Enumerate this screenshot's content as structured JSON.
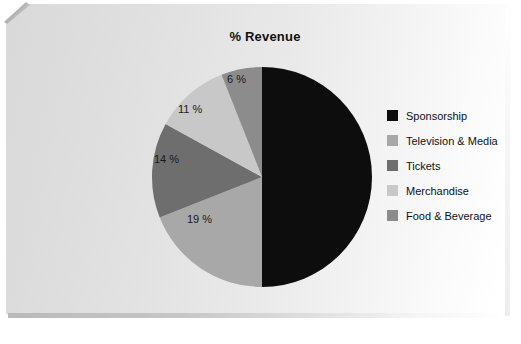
{
  "chart_data": {
    "type": "pie",
    "title": "% Revenue",
    "categories": [
      "Sponsorship",
      "Television & Media",
      "Tickets",
      "Merchandise",
      "Food & Beverage"
    ],
    "values": [
      50,
      19,
      14,
      11,
      6
    ],
    "value_labels": [
      "",
      "19 %",
      "14 %",
      "11 %",
      "6 %"
    ],
    "unit": "%",
    "legend_position": "right",
    "grid": false,
    "colors": [
      "#0d0d0d",
      "#a8a8a8",
      "#6e6e6e",
      "#c8c8c8",
      "#8c8c8c"
    ],
    "slices": [
      {
        "name": "Sponsorship",
        "value": 50,
        "label": "",
        "color": "#0d0d0d",
        "label_shown": false
      },
      {
        "name": "Television & Media",
        "value": 19,
        "label": "19 %",
        "color": "#a8a8a8",
        "label_shown": true
      },
      {
        "name": "Tickets",
        "value": 14,
        "label": "14 %",
        "color": "#6e6e6e",
        "label_shown": true
      },
      {
        "name": "Merchandise",
        "value": 11,
        "label": "11 %",
        "color": "#c8c8c8",
        "label_shown": true
      },
      {
        "name": "Food & Beverage",
        "value": 6,
        "label": "6 %",
        "color": "#8c8c8c",
        "label_shown": true
      }
    ]
  },
  "legend": {
    "items": [
      {
        "label": "Sponsorship",
        "color": "#0d0d0d"
      },
      {
        "label": "Television & Media",
        "color": "#a8a8a8"
      },
      {
        "label": "Tickets",
        "color": "#6e6e6e"
      },
      {
        "label": "Merchandise",
        "color": "#c8c8c8"
      },
      {
        "label": "Food & Beverage",
        "color": "#8c8c8c"
      }
    ]
  },
  "slice_labels": {
    "television_media": "19 %",
    "tickets": "14 %",
    "merchandise": "11 %",
    "food_beverage": "6 %"
  }
}
